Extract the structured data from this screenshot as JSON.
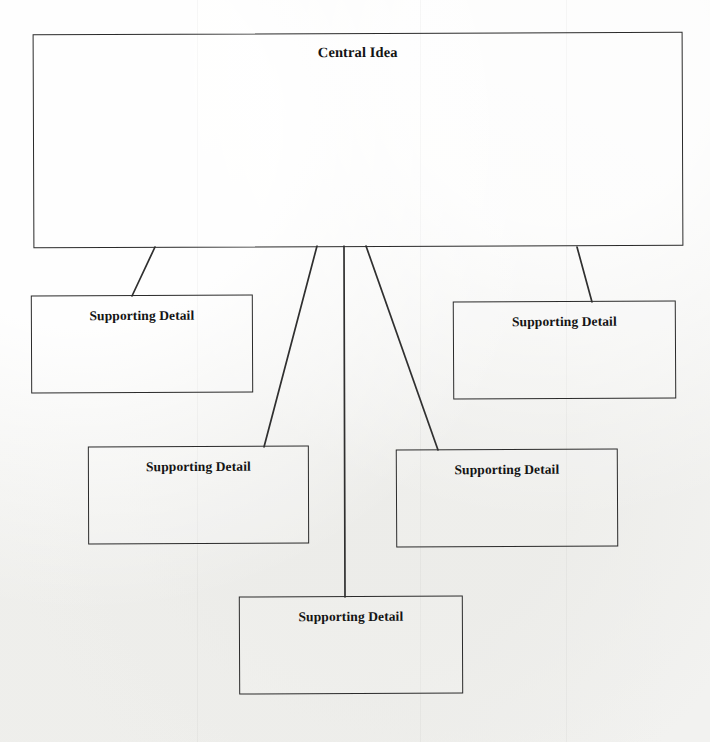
{
  "document": {
    "type": "graphic-organizer",
    "title": "Central Idea and Supporting Details Web"
  },
  "colors": {
    "page_background": "#f2f2f0",
    "box_stroke": "#2b2b2b",
    "connector_stroke": "#2f2f2f",
    "text": "#141414"
  },
  "nodes": {
    "central": {
      "label": "Central Idea",
      "x": 33,
      "y": 33,
      "width": 650,
      "height": 214
    },
    "details": [
      {
        "label": "Supporting Detail",
        "x": 31,
        "y": 295,
        "width": 222,
        "height": 98
      },
      {
        "label": "Supporting Detail",
        "x": 453,
        "y": 301,
        "width": 223,
        "height": 98
      },
      {
        "label": "Supporting Detail",
        "x": 88,
        "y": 446,
        "width": 221,
        "height": 98
      },
      {
        "label": "Supporting Detail",
        "x": 396,
        "y": 449,
        "width": 222,
        "height": 98
      },
      {
        "label": "Supporting Detail",
        "x": 239,
        "y": 596,
        "width": 224,
        "height": 98
      }
    ]
  },
  "connectors": [
    {
      "from": "central",
      "to": "detail-1",
      "x1": 155,
      "y1": 247,
      "x2": 132,
      "y2": 296
    },
    {
      "from": "central",
      "to": "detail-3",
      "x1": 317,
      "y1": 246,
      "x2": 264,
      "y2": 447
    },
    {
      "from": "central",
      "to": "detail-5",
      "x1": 344,
      "y1": 246,
      "x2": 345,
      "y2": 597
    },
    {
      "from": "central",
      "to": "detail-4",
      "x1": 366,
      "y1": 246,
      "x2": 438,
      "y2": 450
    },
    {
      "from": "central",
      "to": "detail-2",
      "x1": 577,
      "y1": 247,
      "x2": 592,
      "y2": 302
    }
  ]
}
